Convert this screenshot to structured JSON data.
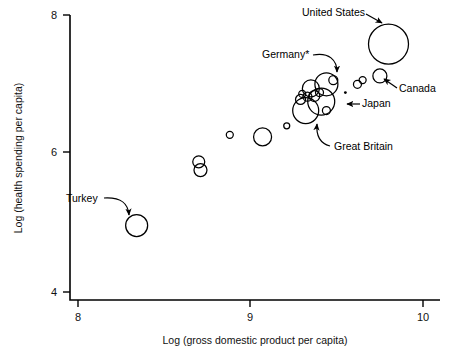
{
  "chart_data": {
    "type": "scatter",
    "title": "",
    "xlabel": "Log (gross domestic product per capita)",
    "ylabel": "Log (health spending per capita)",
    "xlim": [
      7.95,
      10.18
    ],
    "ylim": [
      3.88,
      8.12
    ],
    "xticks": [
      8,
      9,
      10
    ],
    "xticklabels": [
      "8",
      "9",
      "10"
    ],
    "yticks": [
      4,
      6,
      8
    ],
    "yticklabels": [
      "4",
      "6",
      "8"
    ],
    "grid": false,
    "legend": "none",
    "size_encoding": "bubble area proportional to population",
    "points": [
      {
        "label": "Turkey",
        "x": 8.34,
        "y": 4.96,
        "r": 11.0,
        "annotated": true
      },
      {
        "label": "",
        "x": 8.7,
        "y": 5.88,
        "r": 6.0,
        "annotated": false
      },
      {
        "label": "",
        "x": 8.71,
        "y": 5.76,
        "r": 6.5,
        "annotated": false
      },
      {
        "label": "",
        "x": 8.88,
        "y": 6.27,
        "r": 3.5,
        "annotated": false
      },
      {
        "label": "",
        "x": 9.07,
        "y": 6.24,
        "r": 9.0,
        "annotated": false
      },
      {
        "label": "",
        "x": 9.21,
        "y": 6.4,
        "r": 3.0,
        "annotated": false
      },
      {
        "label": "Great Britain",
        "x": 9.32,
        "y": 6.62,
        "r": 13.0,
        "annotated": true
      },
      {
        "label": "",
        "x": 9.29,
        "y": 6.78,
        "r": 5.0,
        "annotated": false
      },
      {
        "label": "",
        "x": 9.3,
        "y": 6.86,
        "r": 3.5,
        "annotated": false
      },
      {
        "label": "",
        "x": 9.33,
        "y": 6.82,
        "r": 4.5,
        "annotated": false
      },
      {
        "label": "",
        "x": 9.35,
        "y": 6.94,
        "r": 8.5,
        "annotated": false
      },
      {
        "label": "",
        "x": 9.37,
        "y": 6.83,
        "r": 5.5,
        "annotated": false
      },
      {
        "label": "",
        "x": 9.4,
        "y": 6.88,
        "r": 4.0,
        "annotated": false
      },
      {
        "label": "Germany",
        "x": 9.44,
        "y": 7.0,
        "r": 11.5,
        "annotated": true
      },
      {
        "label": "Japan",
        "x": 9.41,
        "y": 6.75,
        "r": 13.5,
        "annotated": true
      },
      {
        "label": "",
        "x": 9.44,
        "y": 6.62,
        "r": 4.0,
        "annotated": false
      },
      {
        "label": "",
        "x": 9.48,
        "y": 7.06,
        "r": 4.5,
        "annotated": false
      },
      {
        "label": "",
        "x": 9.55,
        "y": 6.88,
        "r": 1.4,
        "dot": true,
        "annotated": false
      },
      {
        "label": "",
        "x": 9.62,
        "y": 7.0,
        "r": 4.0,
        "annotated": false
      },
      {
        "label": "",
        "x": 9.65,
        "y": 7.06,
        "r": 3.5,
        "annotated": false
      },
      {
        "label": "Canada",
        "x": 9.75,
        "y": 7.12,
        "r": 7.0,
        "annotated": true
      },
      {
        "label": "United States",
        "x": 9.8,
        "y": 7.58,
        "r": 20.0,
        "annotated": true
      }
    ],
    "annotations": [
      {
        "name": "united-states",
        "text": "United States",
        "text_x": 302,
        "text_y": 16,
        "anchor": "start"
      },
      {
        "name": "germany",
        "text": "Germany*",
        "text_x": 262,
        "text_y": 58,
        "anchor": "start"
      },
      {
        "name": "canada",
        "text": "Canada",
        "text_x": 399,
        "text_y": 92,
        "anchor": "start"
      },
      {
        "name": "japan",
        "text": "Japan",
        "text_x": 362,
        "text_y": 107,
        "anchor": "start"
      },
      {
        "name": "great-britain",
        "text": "Great Britain",
        "text_x": 334,
        "text_y": 150,
        "anchor": "start"
      },
      {
        "name": "turkey",
        "text": "Turkey",
        "text_x": 66,
        "text_y": 202,
        "anchor": "start"
      }
    ]
  }
}
